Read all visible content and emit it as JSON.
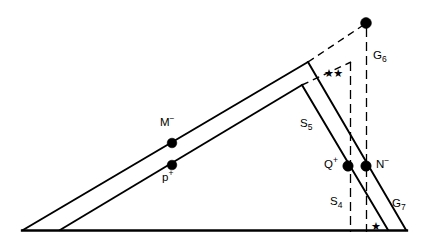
{
  "figure": {
    "kind": "geometric-diagram",
    "background_color": "#ffffff",
    "stroke_color": "#000000",
    "width": 430,
    "height": 247
  },
  "labels": {
    "m_minus": "M",
    "m_minus_sup": "−",
    "p_plus": "p",
    "p_plus_sup": "+",
    "q_plus": "Q",
    "q_plus_sup": "+",
    "n_minus": "N",
    "n_minus_sup": "−",
    "s5": "S",
    "s5_sub": "5",
    "s4": "S",
    "s4_sub": "4",
    "g6": "G",
    "g6_sub": "6",
    "g7": "G",
    "g7_sub": "7",
    "double_star": "★★",
    "single_star": "★"
  },
  "geometry": {
    "baseline": {
      "x1": 23,
      "y1": 230,
      "x2": 406,
      "y2": 230
    },
    "outer_triangle": {
      "apex_left": {
        "x": 23,
        "y": 230
      },
      "apex_top": {
        "x": 308,
        "y": 62
      },
      "apex_right": {
        "x": 406,
        "y": 230
      }
    },
    "inner_triangle": {
      "apex_left": {
        "x": 60,
        "y": 230
      },
      "apex_top": {
        "x": 302,
        "y": 85
      },
      "apex_right": {
        "x": 388,
        "y": 230
      }
    },
    "top_node": {
      "x": 366,
      "y": 23
    },
    "dashed_extension": {
      "x1": 308,
      "y1": 62,
      "x2": 366,
      "y2": 23
    },
    "dashed_inner_extension": {
      "x1": 302,
      "y1": 85,
      "x2": 352,
      "y2": 62
    },
    "vertical_dashdot_left": {
      "x": 350,
      "y1": 62,
      "y2": 232
    },
    "vertical_dashdot_right": {
      "x": 366,
      "y1": 23,
      "y2": 232
    },
    "dots": [
      {
        "name": "M-minus",
        "x": 172,
        "y": 143
      },
      {
        "name": "p-plus",
        "x": 172,
        "y": 165
      },
      {
        "name": "Q-plus",
        "x": 348,
        "y": 166
      },
      {
        "name": "N-minus",
        "x": 366,
        "y": 166
      },
      {
        "name": "top-node",
        "x": 366,
        "y": 23
      }
    ]
  }
}
